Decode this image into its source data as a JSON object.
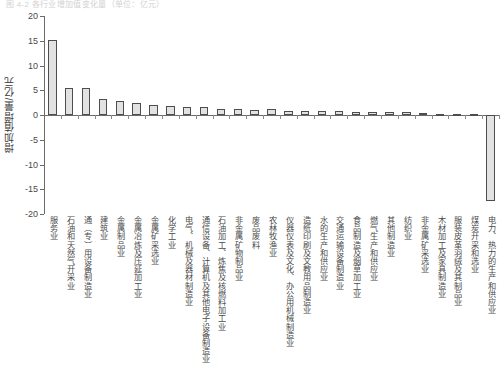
{
  "top_caption": "图 4-2  各行业增加值变化量（单位：亿元）",
  "chart_data": {
    "type": "bar",
    "title": "",
    "xlabel": "",
    "ylabel": "增加值增量/亿元",
    "ylim": [
      -20,
      20
    ],
    "ytick_labels": [
      "20",
      "15",
      "10",
      "5",
      "0",
      "-5",
      "-10",
      "-15",
      "-20"
    ],
    "yticks": [
      20,
      15,
      10,
      5,
      0,
      -5,
      -10,
      -15,
      -20
    ],
    "grid": false,
    "legend": "none",
    "categories": [
      "服务业",
      "石油和天然气开采业",
      "通（专）用设备制造业",
      "建筑业",
      "金属制品业",
      "金属冶炼及压延加工业",
      "金属矿采选业",
      "化学工业",
      "电气、机械及器材制造业",
      "通信设备、计算机及其他电子设备制造业",
      "石油加工、炼焦及核燃料加工业",
      "非金属矿物制品业",
      "废品废料",
      "农林牧渔业",
      "仪器仪表及文化、办公用机械制造业",
      "造纸印刷及文教用品制造业",
      "水的生产和供应业",
      "交通运输设备制造业",
      "食品制造及烟草加工业",
      "燃气生产和供应业",
      "其他制造业",
      "纺织业",
      "非金属矿采选业",
      "木材加工及家具制造业",
      "服装皮革羽绒及其制品业",
      "煤炭开采和选业",
      "电力、热力的生产和供应业"
    ],
    "values": [
      15.1,
      5.5,
      5.4,
      3.2,
      2.9,
      2.4,
      2.0,
      1.8,
      1.7,
      1.6,
      1.3,
      1.3,
      1.1,
      1.3,
      0.8,
      0.8,
      0.8,
      0.8,
      0.7,
      0.7,
      0.7,
      0.6,
      0.4,
      0.3,
      0.3,
      0.25,
      -17.4
    ]
  }
}
